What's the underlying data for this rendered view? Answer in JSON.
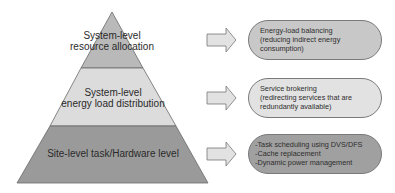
{
  "pyramid": {
    "levels": [
      {
        "line1": "System-level",
        "line2": "resource allocation",
        "color": "#b9b9b9"
      },
      {
        "line1": "System-level",
        "line2": "energy load distribution",
        "color": "#dcdcdc"
      },
      {
        "line1": "Site-level task/Hardware level",
        "color": "#9a9a9a"
      }
    ]
  },
  "boxes": [
    {
      "lines": [
        "Energy-load balancing",
        "(reducing indirect energy",
        "consumption)"
      ],
      "color": "#c8c8c8"
    },
    {
      "lines": [
        "Service brokering",
        "(redirecting services that are",
        "redundantly available)"
      ],
      "color": "#e2e2e2"
    },
    {
      "lines": [
        "-Task scheduling using DVS/DFS",
        "-Cache replacement",
        "-Dynamic power management"
      ],
      "color": "#a0a0a0"
    }
  ]
}
